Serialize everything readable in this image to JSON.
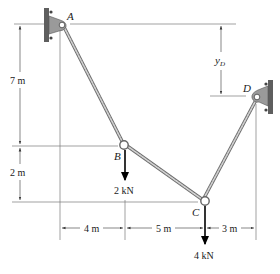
{
  "figure": {
    "type": "cable-system",
    "points": {
      "A": {
        "label": "A",
        "x": 62,
        "y": 24
      },
      "B": {
        "label": "B",
        "x": 125,
        "y": 146
      },
      "C": {
        "label": "C",
        "x": 205,
        "y": 202
      },
      "D": {
        "label": "D",
        "x": 257,
        "y": 97
      }
    },
    "loads": [
      {
        "at": "B",
        "label": "2 kN"
      },
      {
        "at": "C",
        "label": "4 kN"
      }
    ],
    "dimensions": {
      "vertical_AB": "7 m",
      "vertical_BC": "2 m",
      "yD": "y",
      "yD_sub": "D",
      "horizontal": [
        "4 m",
        "5 m",
        "3 m"
      ]
    },
    "colors": {
      "cable": "#6f6f6f",
      "support": "#9a9a9a",
      "wall": "#5e5e5e",
      "force": "#000000",
      "reference": "#7a7a7a"
    }
  }
}
